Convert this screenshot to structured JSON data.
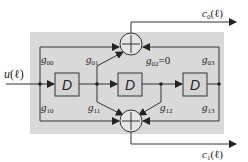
{
  "diagram": {
    "input": {
      "label": "u(ℓ)",
      "var": "u",
      "arg": "(ℓ)"
    },
    "outputs": [
      {
        "var": "c",
        "sub": "0",
        "arg": "(ℓ)"
      },
      {
        "var": "c",
        "sub": "1",
        "arg": "(ℓ)"
      }
    ],
    "delays": [
      {
        "label": "D"
      },
      {
        "label": "D"
      },
      {
        "label": "D"
      }
    ],
    "taps": {
      "g00": {
        "var": "g",
        "sub": "00",
        "suffix": ""
      },
      "g01": {
        "var": "g",
        "sub": "01",
        "suffix": ""
      },
      "g02": {
        "var": "g",
        "sub": "02",
        "suffix": "=0"
      },
      "g03": {
        "var": "g",
        "sub": "03",
        "suffix": ""
      },
      "g10": {
        "var": "g",
        "sub": "10",
        "suffix": ""
      },
      "g11": {
        "var": "g",
        "sub": "11",
        "suffix": ""
      },
      "g12": {
        "var": "g",
        "sub": "12",
        "suffix": ""
      },
      "g13": {
        "var": "g",
        "sub": "13",
        "suffix": ""
      }
    },
    "adders": [
      {
        "name": "top-adder",
        "output": "c0"
      },
      {
        "name": "bottom-adder",
        "output": "c1"
      }
    ],
    "colors": {
      "panel": "#d9d9d9",
      "stroke": "#333333",
      "box_fill": "#d4d4d4"
    }
  }
}
